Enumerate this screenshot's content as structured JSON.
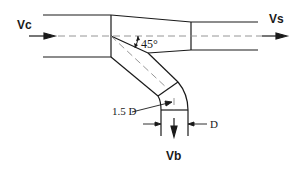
{
  "diagram": {
    "type": "duct-tee-junction",
    "labels": {
      "inlet_velocity": "Vc",
      "straight_velocity": "Vs",
      "branch_velocity": "Vb",
      "branch_angle": "45°",
      "elbow_radius": "1.5 D",
      "branch_diameter": "D"
    },
    "colors": {
      "line": "#1a1a1a",
      "centerline": "#8a8a8a",
      "background": "#ffffff"
    }
  }
}
